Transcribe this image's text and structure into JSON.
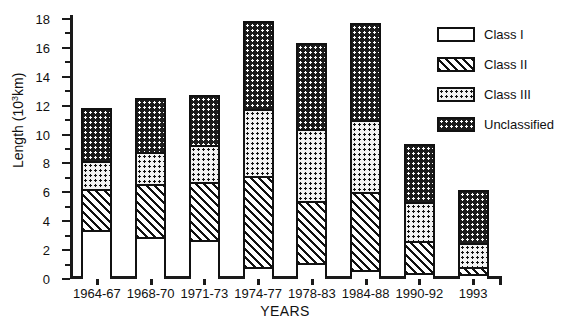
{
  "chart_data": {
    "type": "bar",
    "subtype": "stacked",
    "title": "",
    "xlabel": "YEARS",
    "ylabel": "Length (10³km)",
    "ylabel_base": "Length (10",
    "ylabel_exp": "3",
    "ylabel_tail": "km)",
    "ylim": [
      0,
      18
    ],
    "ytick_step": 2,
    "grid": false,
    "legend_position": "right-top",
    "categories": [
      "1964-67",
      "1968-70",
      "1971-73",
      "1974-77",
      "1978-83",
      "1984-88",
      "1990-92",
      "1993"
    ],
    "yticks": [
      0,
      2,
      4,
      6,
      8,
      10,
      12,
      14,
      16,
      18
    ],
    "ytick_labels": [
      "0",
      "2",
      "4",
      "6",
      "8",
      "10",
      "12",
      "14",
      "16",
      "18"
    ],
    "series": [
      {
        "name": "Class I",
        "fill": "white",
        "values": [
          3.4,
          2.9,
          2.7,
          0.8,
          1.1,
          0.6,
          0.4,
          0.35
        ]
      },
      {
        "name": "Class II",
        "fill": "diagonal-hatch",
        "values": [
          2.8,
          3.7,
          4.0,
          6.3,
          4.3,
          5.4,
          2.2,
          0.5
        ]
      },
      {
        "name": "Class III",
        "fill": "light-dots",
        "values": [
          2.0,
          2.2,
          2.6,
          4.7,
          5.0,
          5.0,
          2.7,
          1.65
        ]
      },
      {
        "name": "Unclassified",
        "fill": "dark-dots",
        "values": [
          3.5,
          3.6,
          3.3,
          5.9,
          5.8,
          6.6,
          3.9,
          3.5
        ]
      }
    ],
    "totals": [
      11.7,
      12.4,
      12.6,
      17.7,
      16.2,
      17.6,
      9.2,
      6.0
    ]
  },
  "legend": {
    "items": [
      {
        "label": "Class I"
      },
      {
        "label": "Class II"
      },
      {
        "label": "Class III"
      },
      {
        "label": "Unclassified"
      }
    ]
  },
  "colors": {
    "axis": "#1a1a1a",
    "text": "#111111",
    "background": "#ffffff",
    "dark_fill": "#1c1c1c"
  }
}
